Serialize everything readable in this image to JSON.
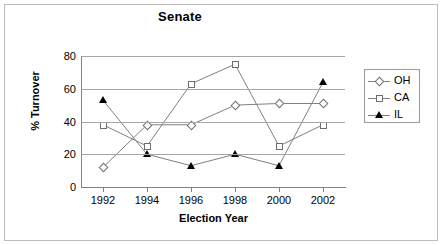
{
  "chart_data": {
    "type": "line",
    "title": "Senate",
    "xlabel": "Election Year",
    "ylabel": "% Turnover",
    "categories": [
      "1992",
      "1994",
      "1996",
      "1998",
      "2000",
      "2002"
    ],
    "x": [
      1992,
      1994,
      1996,
      1998,
      2000,
      2002
    ],
    "series": [
      {
        "name": "OH",
        "marker": "open-diamond",
        "values": [
          12,
          38,
          38,
          50,
          51,
          51
        ]
      },
      {
        "name": "CA",
        "marker": "open-square",
        "values": [
          38,
          25,
          63,
          75,
          25,
          38
        ]
      },
      {
        "name": "IL",
        "marker": "filled-triangle",
        "values": [
          53,
          20,
          13,
          20,
          13,
          64
        ]
      }
    ],
    "ylim": [
      0,
      80
    ],
    "yticks": [
      0,
      20,
      40,
      60,
      80
    ],
    "ytick_labels": [
      "0",
      "20",
      "40",
      "60",
      "80"
    ],
    "xlim": [
      1991,
      2003
    ],
    "grid": "horizontal",
    "legend_position": "right",
    "legend_entries": [
      "OH",
      "CA",
      "IL"
    ],
    "colors": {
      "line": "#7f7f7f",
      "grid": "#a6a6a6",
      "axis": "#808080",
      "il_marker": "#000000",
      "background": "#ffffff",
      "border": "#bdbdbd"
    }
  },
  "legend": {
    "items": [
      {
        "label": "OH",
        "icon": "open-diamond-marker-icon"
      },
      {
        "label": "CA",
        "icon": "open-square-marker-icon"
      },
      {
        "label": "IL",
        "icon": "filled-triangle-marker-icon"
      }
    ]
  }
}
